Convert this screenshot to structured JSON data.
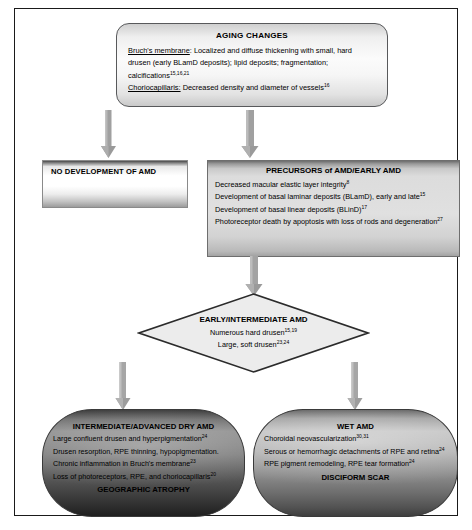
{
  "diagram": {
    "colors": {
      "page_border": "#1a1a1a",
      "arrow": "#9a9a9a",
      "diamond_fill": "#ececec",
      "diamond_stroke": "#2b2b2b"
    }
  },
  "aging": {
    "title": "AGING CHANGES",
    "lines": [
      {
        "label": "Bruch's membrane",
        "text": ": Localized and diffuse thickening with small, hard drusen (early BLamD deposits); lipid deposits; fragmentation; calcifications",
        "ref": "15,16,21"
      },
      {
        "label": "Choriocapillaris:",
        "text": " Decreased density and diameter of vessels",
        "ref": "16"
      }
    ]
  },
  "no_development": {
    "title": "NO DEVELOPMENT OF AMD"
  },
  "precursors": {
    "title": "PRECURSORS of AMD/EARLY AMD",
    "items": [
      {
        "text": "Decreased macular elastic layer integrity",
        "ref": "8"
      },
      {
        "text": "Development of basal laminar deposits (BLamD), early and late",
        "ref": "15"
      },
      {
        "text": "Development of basal linear deposits (BLinD)",
        "ref": "17"
      },
      {
        "text": "Photoreceptor death by apoptosis with loss of rods and degeneration",
        "ref": "27"
      }
    ]
  },
  "early_intermediate": {
    "title": "EARLY/INTERMEDIATE AMD",
    "items": [
      {
        "text": "Numerous hard drusen",
        "ref": "15,19"
      },
      {
        "text": "Large, soft drusen",
        "ref": "23,24"
      }
    ]
  },
  "dry_amd": {
    "title": "INTERMEDIATE/ADVANCED DRY AMD",
    "items": [
      {
        "text": "Large confluent drusen and hyperpigmentation",
        "ref": "24"
      },
      {
        "text": "Drusen resorption, RPE thinning, hypopigmentation.",
        "ref": ""
      },
      {
        "text": "Chronic inflammation in Bruch's membrane",
        "ref": "23"
      },
      {
        "text": "Loss of photoreceptors, RPE, and choriocapillaris",
        "ref": "20"
      }
    ],
    "outcome": "GEOGRAPHIC ATROPHY"
  },
  "wet_amd": {
    "title": "WET AMD",
    "items": [
      {
        "text": "Choroidal neovascularization",
        "ref": "30,31"
      },
      {
        "text": "Serous or hemorrhagic detachments of RPE and retina",
        "ref": "24"
      },
      {
        "text": "RPE pigment remodeling, RPE tear formation",
        "ref": "24"
      }
    ],
    "outcome": "DISCIFORM SCAR"
  }
}
